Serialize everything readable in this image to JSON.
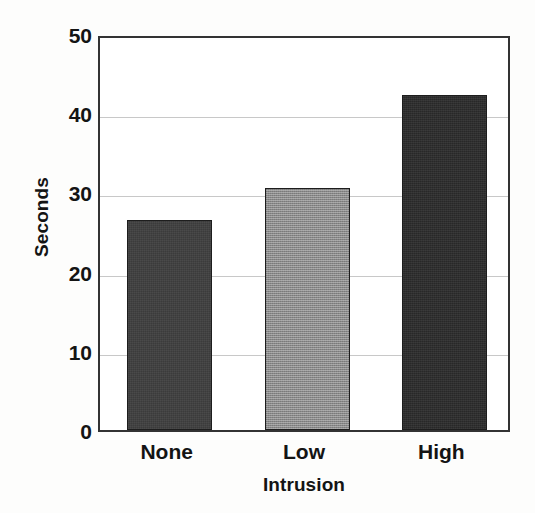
{
  "chart_data": {
    "type": "bar",
    "title": "",
    "xlabel": "Intrusion",
    "ylabel": "Seconds",
    "categories": [
      "None",
      "Low",
      "High"
    ],
    "values": [
      26.5,
      30.5,
      42.3
    ],
    "series": [
      {
        "name": "Mean response time",
        "values": [
          26.5,
          30.5,
          42.3
        ]
      }
    ],
    "ylim": [
      0,
      50
    ],
    "yticks": [
      0,
      10,
      20,
      30,
      40,
      50
    ],
    "ytick_labels": [
      "0",
      "10",
      "20",
      "30",
      "40",
      "50"
    ],
    "grid": true,
    "gridlines_at": [
      10,
      20,
      30,
      40
    ],
    "legend": "none",
    "bar_colors": [
      "#3b3b3b",
      "#888888",
      "#282828"
    ],
    "frame_color": "#333333",
    "gridline_color": "#c8c8c8",
    "background": "#ffffff"
  }
}
